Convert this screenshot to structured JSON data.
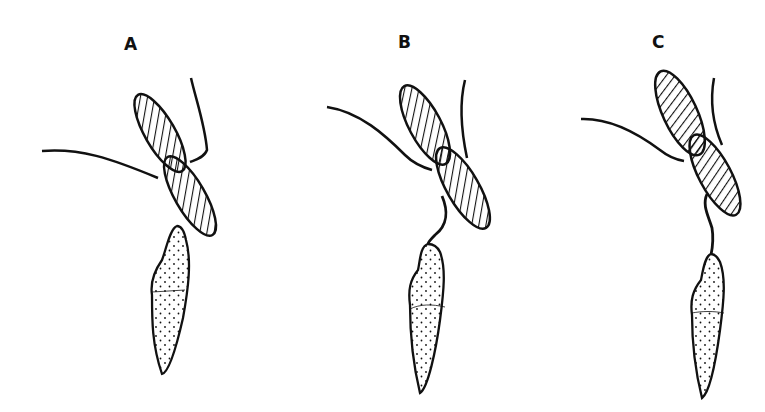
{
  "figure": {
    "panels": [
      {
        "label": "A",
        "state": "separated"
      },
      {
        "label": "B",
        "state": "connected by tube"
      },
      {
        "label": "C",
        "state": "connected by tube"
      }
    ],
    "legend_hidden": true,
    "elements": {
      "hatched_cell": "biflagellate cell (diagonal hatching)",
      "stippled_cell": "dotted cell",
      "connector": "connecting tube"
    },
    "colors": {
      "ink": "#111111",
      "background": "#ffffff"
    }
  }
}
